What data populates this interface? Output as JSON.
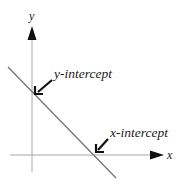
{
  "diagram": {
    "type": "linear-function-intercepts",
    "axes": {
      "x_label": "x",
      "y_label": "y",
      "axis_color": "#a0a0a0",
      "arrow_color": "#111111"
    },
    "line": {
      "description": "Line with negative slope crossing both axes",
      "color": "#6e6e6e"
    },
    "annotations": [
      {
        "id": "y-intercept",
        "label": "y-intercept",
        "arrow_color": "#111111"
      },
      {
        "id": "x-intercept",
        "label": "x-intercept",
        "arrow_color": "#111111"
      }
    ]
  }
}
